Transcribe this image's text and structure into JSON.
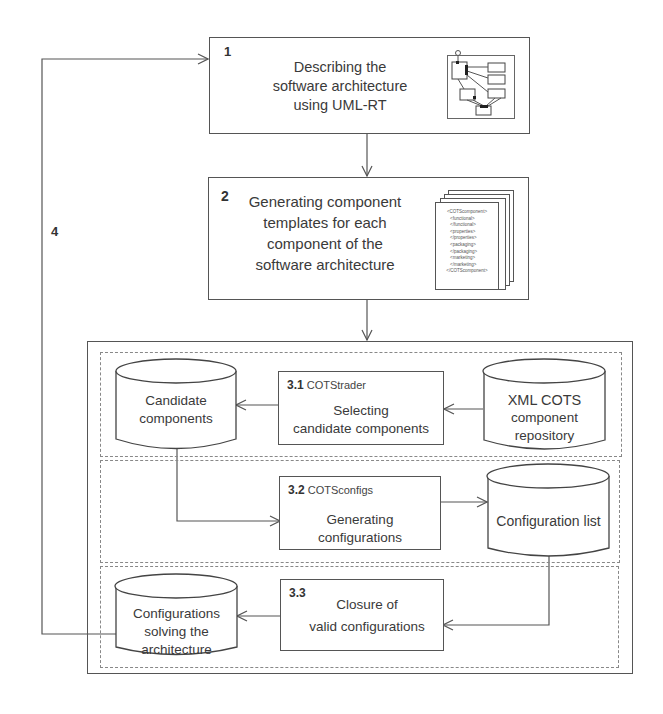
{
  "diagram": {
    "step1": {
      "number": "1",
      "lines": [
        "Describing the",
        "software architecture",
        "using UML-RT"
      ],
      "thumbnail": "uml-rt-diagram-icon"
    },
    "step2": {
      "number": "2",
      "lines": [
        "Generating component",
        "templates for each",
        "component of the",
        "software architecture"
      ],
      "thumbnail": "xml-template-stack-icon",
      "xml_lines": [
        "<COTScomponent>",
        "<functional>",
        "</functional>",
        "<properties>",
        "</properties>",
        "<packaging>",
        "</packaging>",
        "<marketing>",
        "</marketing>",
        "</COTScomponent>"
      ]
    },
    "step3_1": {
      "number": "3.1",
      "tool": "COTStrader",
      "lines": [
        "Selecting",
        "candidate components"
      ]
    },
    "step3_2": {
      "number": "3.2",
      "tool": "COTSconfigs",
      "lines": [
        "Generating",
        "configurations"
      ]
    },
    "step3_3": {
      "number": "3.3",
      "tool": "",
      "lines": [
        "Closure of",
        "valid configurations"
      ]
    },
    "datastores": {
      "candidate": [
        "Candidate",
        "components"
      ],
      "repository": [
        "XML COTS",
        "component",
        "repository"
      ],
      "config_list": [
        "Configuration list"
      ],
      "solving": [
        "Configurations",
        "solving the",
        "architecture"
      ]
    },
    "loop_label": "4"
  }
}
